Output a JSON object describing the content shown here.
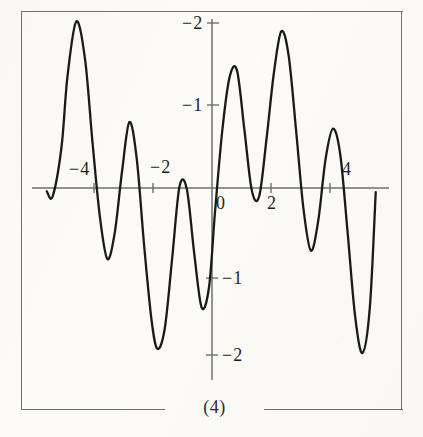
{
  "figure": {
    "caption": "(4)",
    "border_color": "#6f6f6d",
    "curve_color": "#1a1a1a",
    "axis_color": "#6f6f6d",
    "paper_color": "#fcfbf8"
  },
  "axis_labels": {
    "x": [
      {
        "id": "x-neg-4",
        "text": "4",
        "negative": true,
        "value": -4
      },
      {
        "id": "x-neg-2",
        "text": "2",
        "negative": true,
        "value": -2
      },
      {
        "id": "x-zero",
        "text": "0",
        "negative": false,
        "value": 0
      },
      {
        "id": "x-pos-2",
        "text": "2",
        "negative": false,
        "value": 2
      },
      {
        "id": "x-pos-4",
        "text": "4",
        "negative": false,
        "value": 4
      }
    ],
    "y": [
      {
        "id": "y-pos-2",
        "text": "2",
        "negative": false,
        "value": 2
      },
      {
        "id": "y-pos-1",
        "text": "1",
        "negative": false,
        "value": 1
      },
      {
        "id": "y-neg-1",
        "text": "1",
        "negative": true,
        "value": -1
      },
      {
        "id": "y-neg-2",
        "text": "2",
        "negative": true,
        "value": -2
      }
    ]
  },
  "chart_data": {
    "type": "line",
    "title": "(4)",
    "xlabel": "",
    "ylabel": "",
    "xlim": [
      -5.6,
      5.6
    ],
    "ylim": [
      -2.3,
      2.15
    ],
    "grid": false,
    "legend": null,
    "xticks": [
      -4,
      -2,
      0,
      2,
      4
    ],
    "yticks": [
      -2,
      -1,
      1,
      2
    ],
    "axes_style": "crossed-at-origin",
    "series": [
      {
        "name": "f(x)",
        "x": [
          -5.6,
          -5.4,
          -5.1,
          -4.9,
          -4.6,
          -4.3,
          -4.05,
          -3.8,
          -3.55,
          -3.3,
          -3.05,
          -2.8,
          -2.55,
          -2.3,
          -2.05,
          -1.85,
          -1.6,
          -1.35,
          -1.1,
          -0.85,
          -0.6,
          -0.35,
          -0.1,
          0.1,
          0.35,
          0.6,
          0.85,
          1.1,
          1.35,
          1.6,
          1.85,
          2.1,
          2.35,
          2.6,
          2.85,
          3.1,
          3.35,
          3.6,
          3.85,
          4.1,
          4.35,
          4.6,
          4.85,
          5.1,
          5.35,
          5.55
        ],
        "y": [
          -0.04,
          -0.1,
          0.5,
          1.35,
          2.02,
          1.55,
          0.55,
          -0.35,
          -0.86,
          -0.55,
          0.2,
          0.8,
          0.35,
          -0.7,
          -1.6,
          -1.95,
          -1.7,
          -0.85,
          0.02,
          -0.02,
          -0.8,
          -1.45,
          -1.2,
          -0.3,
          0.7,
          1.35,
          1.42,
          0.7,
          -0.03,
          -0.1,
          0.6,
          1.4,
          1.9,
          1.6,
          0.7,
          -0.25,
          -0.76,
          -0.4,
          0.35,
          0.72,
          0.4,
          -0.55,
          -1.55,
          -2.0,
          -1.45,
          -0.05
        ]
      }
    ]
  }
}
